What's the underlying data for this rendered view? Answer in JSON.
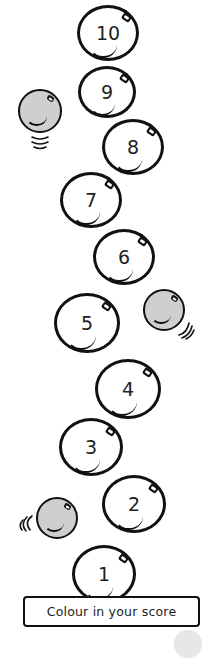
{
  "worksheet": {
    "instruction": "Colour in your score",
    "bubbles": [
      {
        "label": "10",
        "cx": 108,
        "cy": 33,
        "r": 31
      },
      {
        "label": "9",
        "cx": 107,
        "cy": 92,
        "r": 29
      },
      {
        "label": "8",
        "cx": 133,
        "cy": 147,
        "r": 31
      },
      {
        "label": "7",
        "cx": 91,
        "cy": 200,
        "r": 31
      },
      {
        "label": "6",
        "cx": 124,
        "cy": 257,
        "r": 31
      },
      {
        "label": "5",
        "cx": 87,
        "cy": 323,
        "r": 33
      },
      {
        "label": "4",
        "cx": 128,
        "cy": 389,
        "r": 33
      },
      {
        "label": "3",
        "cx": 91,
        "cy": 447,
        "r": 32
      },
      {
        "label": "2",
        "cx": 134,
        "cy": 504,
        "r": 32
      },
      {
        "label": "1",
        "cx": 104,
        "cy": 574,
        "r": 32
      }
    ],
    "grey_balls": [
      {
        "cx": 40,
        "cy": 111,
        "r": 22,
        "motion": "below"
      },
      {
        "cx": 164,
        "cy": 310,
        "r": 21,
        "motion": "right-below"
      },
      {
        "cx": 57,
        "cy": 518,
        "r": 21,
        "motion": "left"
      }
    ],
    "colors": {
      "outline": "#111111",
      "ball_fill": "#cfcfcf",
      "background": "#ffffff"
    }
  }
}
